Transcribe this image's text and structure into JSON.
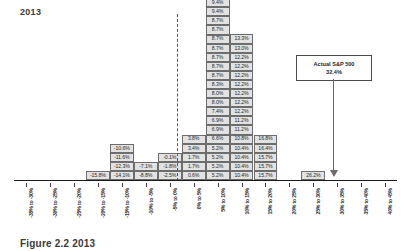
{
  "title": "2013",
  "caption": "Figure 2.2  2013",
  "callout": {
    "line1": "Actual S&P 500",
    "line2": "32.4%"
  },
  "chart_data": {
    "type": "bar",
    "title": "2013",
    "xlabel": "",
    "ylabel": "",
    "grid": false,
    "legend": "none",
    "annotations": [
      {
        "text": "Actual S&P 500 32.4%",
        "points_to": "30% to 35%"
      }
    ],
    "zero_line": "0%",
    "categories": [
      "-35% to -30%",
      "-30% to -25%",
      "-25% to -20%",
      "-20% to -15%",
      "-15% to -10%",
      "-10% to -5%",
      "-5% to 0%",
      "0% to 5%",
      "5% to 10%",
      "10% to 15%",
      "15% to 20%",
      "20% to 25%",
      "25% to 30%",
      "30% to 35%",
      "35% to 40%",
      "40% to 45%"
    ],
    "values": [
      0,
      0,
      0,
      1,
      4,
      2,
      3,
      5,
      20,
      16,
      5,
      0,
      1,
      0,
      0,
      0
    ],
    "stacks": [
      [],
      [],
      [],
      [
        "-15.8%"
      ],
      [
        "-14.1%",
        "-12.3%",
        "-11.6%",
        "-10.6%"
      ],
      [
        "-8.8%",
        "-7.1%"
      ],
      [
        "-2.5%",
        "-1.8%",
        "-0.1%"
      ],
      [
        "0.6%",
        "1.7%",
        "1.7%",
        "3.4%",
        "3.8%"
      ],
      [
        "5.2%",
        "5.2%",
        "5.2%",
        "5.2%",
        "6.6%",
        "6.9%",
        "6.9%",
        "7.4%",
        "8.0%",
        "8.0%",
        "8.3%",
        "8.7%",
        "8.7%",
        "8.7%",
        "8.7%",
        "8.7%",
        "8.7%",
        "8.7%",
        "9.4%",
        "9.4%"
      ],
      [
        "10.4%",
        "10.4%",
        "10.4%",
        "10.4%",
        "10.8%",
        "11.2%",
        "11.2%",
        "12.2%",
        "12.2%",
        "12.2%",
        "12.2%",
        "12.2%",
        "12.2%",
        "12.2%",
        "13.0%",
        "13.3%"
      ],
      [
        "15.7%",
        "15.7%",
        "15.7%",
        "16.4%",
        "16.8%"
      ],
      [],
      [
        "26.2%"
      ],
      [],
      []
    ]
  }
}
